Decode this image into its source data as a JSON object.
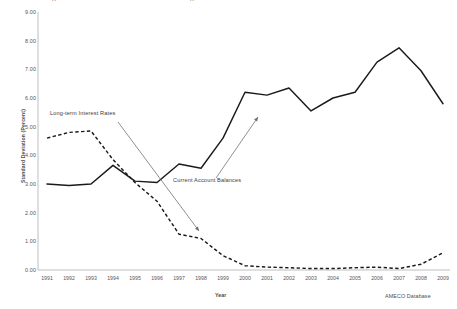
{
  "figure": {
    "title_remnant_left": "g",
    "title_remnant_right": "g",
    "source_note": "AMECO Database"
  },
  "chart_data": {
    "type": "line",
    "title": "",
    "subtitle": "",
    "xlabel": "Year",
    "ylabel": "Standard Deviation (Percent)",
    "x": [
      1991,
      1992,
      1993,
      1994,
      1995,
      1996,
      1997,
      1998,
      1999,
      2000,
      2001,
      2002,
      2003,
      2004,
      2005,
      2006,
      2007,
      2008,
      2009
    ],
    "categories": [
      "1991",
      "1992",
      "1993",
      "1994",
      "1995",
      "1996",
      "1997",
      "1998",
      "1999",
      "2000",
      "2001",
      "2002",
      "2003",
      "2004",
      "2005",
      "2006",
      "2007",
      "2008",
      "2009"
    ],
    "xlim": [
      1991,
      2009
    ],
    "ylim": [
      0.0,
      9.0
    ],
    "yticks": [
      "0.00",
      "1.00",
      "2.00",
      "3.00",
      "4.00",
      "5.00",
      "6.00",
      "7.00",
      "8.00",
      "9.00"
    ],
    "ytick_values": [
      0,
      1,
      2,
      3,
      4,
      5,
      6,
      7,
      8,
      9
    ],
    "grid": false,
    "legend_position": "inline-annotations",
    "series": [
      {
        "name": "Current Account Balances",
        "style": "solid",
        "color": "#1a1a1a",
        "values": [
          3.0,
          2.95,
          3.0,
          3.65,
          3.1,
          3.05,
          3.7,
          3.55,
          4.6,
          6.2,
          6.1,
          6.35,
          5.55,
          6.0,
          6.2,
          7.25,
          7.75,
          6.95,
          5.8
        ]
      },
      {
        "name": "Long-term Interest Rates",
        "style": "dashed",
        "color": "#1a1a1a",
        "values": [
          4.6,
          4.8,
          4.85,
          3.85,
          3.05,
          2.4,
          1.25,
          1.1,
          0.5,
          0.15,
          0.1,
          0.08,
          0.05,
          0.05,
          0.08,
          0.1,
          0.05,
          0.2,
          0.6
        ]
      }
    ],
    "annotations": [
      {
        "text": "Long-term Interest Rates",
        "arrow": "down-right"
      },
      {
        "text": "Current Account Balances",
        "arrow": "up-right"
      }
    ]
  }
}
